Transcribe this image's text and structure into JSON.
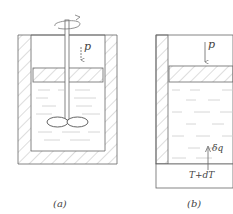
{
  "figure": {
    "panel_a": {
      "caption": "(a)",
      "pressure_label": "p",
      "description": "Stirred vessel with piston and impeller"
    },
    "panel_b": {
      "caption": "(b)",
      "pressure_label": "p",
      "heat_label": "δq",
      "reservoir_label": "T+dT",
      "description": "Vessel with piston heated from below"
    }
  },
  "colors": {
    "line": "#555555",
    "hatch": "#aaaaaa",
    "fluid": "#cccccc"
  }
}
